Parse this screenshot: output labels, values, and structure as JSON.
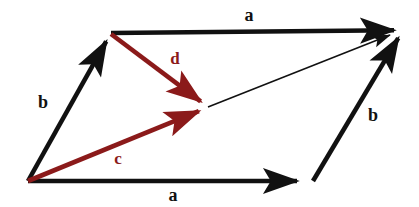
{
  "figure": {
    "width": 419,
    "height": 207,
    "background_color": "#ffffff"
  },
  "colors": {
    "vector_black": "#111111",
    "vector_red": "#8B1A1A",
    "background": "#ffffff"
  },
  "geometry": {
    "origin": {
      "x": 28,
      "y": 181
    },
    "top_left": {
      "x": 111,
      "y": 33
    },
    "top_right": {
      "x": 403,
      "y": 30
    },
    "bottom_right": {
      "x": 313,
      "y": 181
    },
    "center": {
      "x": 208,
      "y": 107
    }
  },
  "vectors": [
    {
      "id": "a-bottom",
      "label": "a",
      "color": "#111111",
      "weight": "thick",
      "from": {
        "x": 28,
        "y": 181
      },
      "to": {
        "x": 306,
        "y": 181
      },
      "label_pos": {
        "x": 173,
        "y": 195
      }
    },
    {
      "id": "a-top",
      "label": "a",
      "color": "#111111",
      "weight": "thick",
      "from": {
        "x": 111,
        "y": 33
      },
      "to": {
        "x": 403,
        "y": 30
      },
      "label_pos": {
        "x": 249,
        "y": 15
      }
    },
    {
      "id": "b-left",
      "label": "b",
      "color": "#111111",
      "weight": "thick",
      "from": {
        "x": 28,
        "y": 181
      },
      "to": {
        "x": 111,
        "y": 33
      },
      "label_pos": {
        "x": 43,
        "y": 102
      }
    },
    {
      "id": "b-right",
      "label": "b",
      "color": "#111111",
      "weight": "thick",
      "from": {
        "x": 313,
        "y": 181
      },
      "to": {
        "x": 403,
        "y": 30
      },
      "label_pos": {
        "x": 373,
        "y": 115
      }
    },
    {
      "id": "c",
      "label": "c",
      "color": "#8B1A1A",
      "weight": "thick",
      "from": {
        "x": 28,
        "y": 181
      },
      "to": {
        "x": 208,
        "y": 107
      },
      "label_pos": {
        "x": 118,
        "y": 158
      }
    },
    {
      "id": "d",
      "label": "d",
      "color": "#8B1A1A",
      "weight": "thick",
      "from": {
        "x": 111,
        "y": 34
      },
      "to": {
        "x": 208,
        "y": 107
      },
      "label_pos": {
        "x": 175,
        "y": 58
      }
    },
    {
      "id": "diagonal",
      "label": "",
      "color": "#111111",
      "weight": "thin",
      "from": {
        "x": 208,
        "y": 107
      },
      "to": {
        "x": 403,
        "y": 30
      },
      "label_pos": null
    }
  ],
  "labels": {
    "a_top": "a",
    "a_bottom": "a",
    "b_left": "b",
    "b_right": "b",
    "c": "c",
    "d": "d"
  },
  "label_style": {
    "a_top_size": "18px",
    "a_bottom_size": "18px",
    "b_left_size": "18px",
    "b_right_size": "18px",
    "c_size": "17px",
    "d_size": "17px"
  }
}
